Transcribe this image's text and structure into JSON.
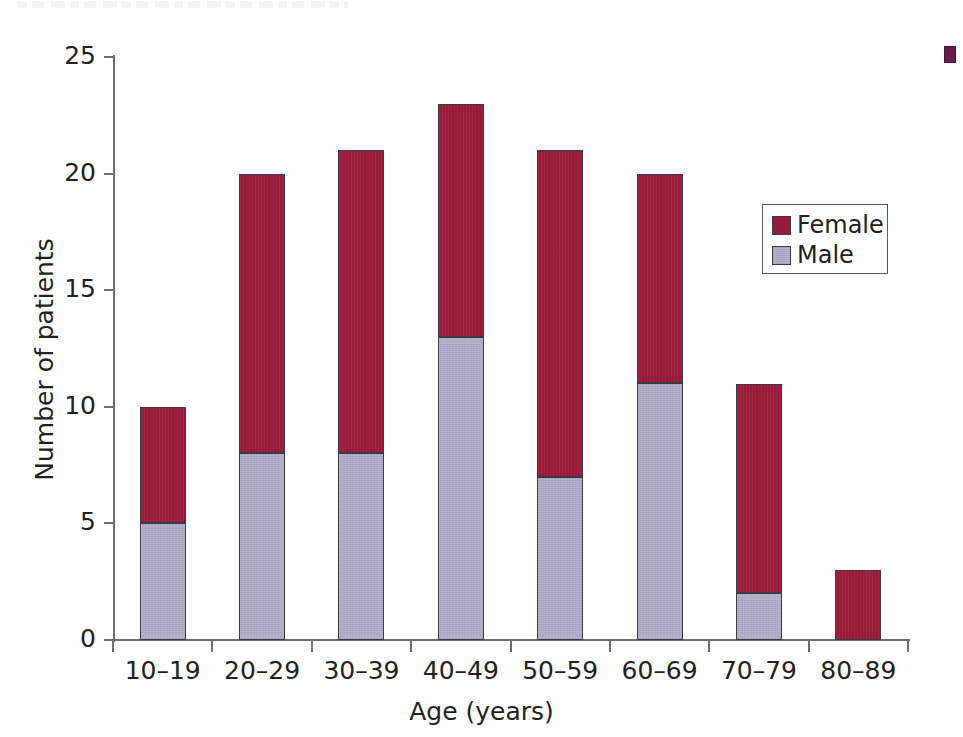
{
  "chart_data": {
    "type": "bar",
    "subtype": "stacked-vertical",
    "title": "",
    "xlabel": "Age (years)",
    "ylabel": "Number of patients",
    "categories": [
      "10–19",
      "20–29",
      "30–39",
      "40–49",
      "50–59",
      "60–69",
      "70–79",
      "80–89"
    ],
    "series": [
      {
        "name": "Male",
        "color": "#b3aecb",
        "values": [
          5,
          8,
          8,
          13,
          7,
          11,
          2,
          0
        ]
      },
      {
        "name": "Female",
        "color": "#9e1b3c",
        "values": [
          5,
          12,
          13,
          10,
          14,
          9,
          9,
          3
        ]
      }
    ],
    "totals": [
      10,
      20,
      21,
      23,
      21,
      20,
      11,
      3
    ],
    "ylim": [
      0,
      25
    ],
    "yticks": [
      0,
      5,
      10,
      15,
      20,
      25
    ],
    "ytick_labels": [
      "0",
      "5",
      "10",
      "15",
      "20",
      "25"
    ],
    "grid": false,
    "legend_position": "upper right inside plot",
    "stack_order_bottom_to_top": [
      "Male",
      "Female"
    ]
  },
  "legend": {
    "entries": [
      {
        "label": "Female",
        "color": "#9e1b3c"
      },
      {
        "label": "Male",
        "color": "#b3aecb"
      }
    ]
  },
  "axes": {
    "x_title": "Age (years)",
    "y_title": "Number of patients"
  },
  "margin_note": {
    "line1": "",
    "line2": ""
  },
  "colors": {
    "female": "#9e1b3c",
    "male": "#b3aecb",
    "axis": "#6d6e71",
    "text": "#231f20",
    "bar_outline": "#3b3b46",
    "background": "#ffffff"
  }
}
